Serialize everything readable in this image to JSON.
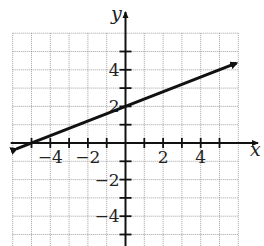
{
  "chart_data": {
    "type": "line",
    "title": "",
    "xlabel": "x",
    "ylabel": "y",
    "xlim": [
      -6,
      6
    ],
    "ylim": [
      -5.7,
      6
    ],
    "grid": true,
    "x_ticks": [
      -4,
      -2,
      2,
      4
    ],
    "y_ticks": [
      4,
      2,
      -2,
      -4
    ],
    "x_tick_labels": [
      "−4",
      "−2",
      "2",
      "4"
    ],
    "y_tick_labels": [
      "4",
      "2",
      "−2",
      "−4"
    ],
    "series": [
      {
        "name": "y = 0.4x + 2",
        "equation": "y = (2/5)x + 2",
        "x": [
          -5.8,
          5.9
        ],
        "y": [
          -0.32,
          4.36
        ],
        "arrows": "both",
        "points_of_interest": {
          "x_intercept": [
            -5,
            0
          ],
          "y_intercept": [
            0,
            2
          ]
        }
      }
    ],
    "color": "#111111"
  }
}
